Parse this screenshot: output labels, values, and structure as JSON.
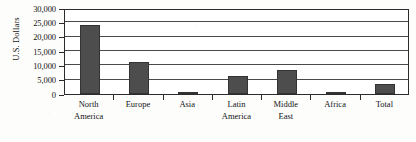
{
  "chart_data": {
    "type": "bar",
    "title": "",
    "xlabel": "",
    "ylabel": "U.S. Dollars",
    "categories": [
      "North America",
      "Europe",
      "Asia",
      "Latin America",
      "Middle East",
      "Africa",
      "Total"
    ],
    "category_lines": [
      [
        "North",
        "America"
      ],
      [
        "Europe"
      ],
      [
        "Asia"
      ],
      [
        "Latin",
        "America"
      ],
      [
        "Middle",
        "East"
      ],
      [
        "Africa"
      ],
      [
        "Total"
      ]
    ],
    "values": [
      24000,
      11000,
      700,
      6200,
      8500,
      600,
      3500
    ],
    "ylim": [
      0,
      30000
    ],
    "ytick_values": [
      0,
      5000,
      10000,
      15000,
      20000,
      25000,
      30000
    ],
    "ytick_labels": [
      "0",
      "5,000",
      "10,000",
      "15,000",
      "20,000",
      "25,000",
      "30,000"
    ],
    "grid": true,
    "legend": false,
    "bar_color": "#4d4d4d",
    "axis_color": "#2b2b2b",
    "background_color": "#ffffff"
  }
}
